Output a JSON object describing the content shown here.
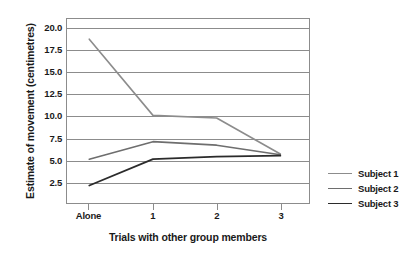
{
  "chart_data": {
    "type": "line",
    "title": "",
    "xlabel": "Trials with other group members",
    "ylabel": "Estimate of movement (centimetres)",
    "categories": [
      "Alone",
      "1",
      "2",
      "3"
    ],
    "xtick_labels": [
      "Alone",
      "1",
      "2",
      "3"
    ],
    "ytick_labels": [
      "2.5",
      "5.0",
      "7.5",
      "10.0",
      "12.5",
      "15.0",
      "17.5",
      "20.0"
    ],
    "ytick_values": [
      2.5,
      5.0,
      7.5,
      10.0,
      12.5,
      15.0,
      17.5,
      20.0
    ],
    "ylim": [
      0,
      21.0
    ],
    "xlim": [
      -0.35,
      3.45
    ],
    "grid": true,
    "legend_position": "right",
    "series": [
      {
        "name": "Subject 1",
        "color": "#8c8c8c",
        "width": 1.6,
        "values": [
          18.7,
          10.0,
          9.7,
          5.6
        ]
      },
      {
        "name": "Subject 2",
        "color": "#6e6e6e",
        "width": 1.6,
        "values": [
          5.0,
          7.0,
          6.6,
          5.5
        ]
      },
      {
        "name": "Subject 3",
        "color": "#2b2b2b",
        "width": 1.8,
        "values": [
          2.0,
          5.0,
          5.3,
          5.4
        ]
      }
    ]
  },
  "colors": {
    "background": "#ffffff",
    "axis": "#8c8c8c",
    "grid": "#8c8c8c",
    "text": "#1a1a1a"
  }
}
